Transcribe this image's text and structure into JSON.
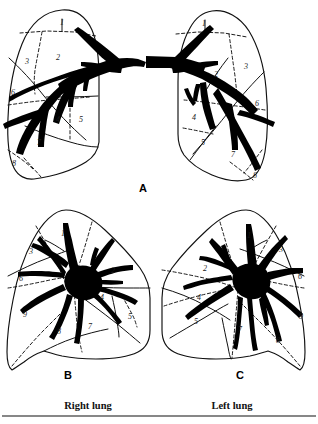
{
  "figure": {
    "background_color": "#ffffff",
    "ink_color": "#111111",
    "bronchus_color": "#000000",
    "width": 318,
    "height": 424
  },
  "panels": [
    {
      "id": "A",
      "letter": "A",
      "letter_x": 143,
      "letter_y": 189,
      "view": "anterior view of both lungs",
      "lungs": [
        {
          "side": "right",
          "segment_labels": [
            {
              "n": "1",
              "x": 62,
              "y": 23
            },
            {
              "n": "2",
              "x": 58,
              "y": 58
            },
            {
              "n": "3",
              "x": 27,
              "y": 62
            },
            {
              "n": "6",
              "x": 13,
              "y": 93
            },
            {
              "n": "4",
              "x": 58,
              "y": 120
            },
            {
              "n": "5",
              "x": 81,
              "y": 120
            },
            {
              "n": "7",
              "x": 39,
              "y": 143
            },
            {
              "n": "8",
              "x": 14,
              "y": 164
            }
          ]
        },
        {
          "side": "left",
          "segment_labels": [
            {
              "n": "1",
              "x": 204,
              "y": 24
            },
            {
              "n": "2",
              "x": 216,
              "y": 75
            },
            {
              "n": "3",
              "x": 246,
              "y": 67
            },
            {
              "n": "6",
              "x": 257,
              "y": 104
            },
            {
              "n": "4",
              "x": 194,
              "y": 118
            },
            {
              "n": "5",
              "x": 203,
              "y": 143
            },
            {
              "n": "7",
              "x": 233,
              "y": 155
            },
            {
              "n": "8",
              "x": 255,
              "y": 176
            }
          ]
        }
      ]
    },
    {
      "id": "B",
      "letter": "B",
      "letter_x": 68,
      "letter_y": 376,
      "view": "right lung medial surface",
      "segment_labels": [
        {
          "n": "1",
          "x": 63,
          "y": 234
        },
        {
          "n": "3",
          "x": 31,
          "y": 252
        },
        {
          "n": "2",
          "x": 113,
          "y": 271
        },
        {
          "n": "6",
          "x": 21,
          "y": 279
        },
        {
          "n": "4",
          "x": 102,
          "y": 298
        },
        {
          "n": "9",
          "x": 25,
          "y": 315
        },
        {
          "n": "5",
          "x": 130,
          "y": 317
        },
        {
          "n": "7",
          "x": 90,
          "y": 327
        },
        {
          "n": "8",
          "x": 59,
          "y": 332
        }
      ]
    },
    {
      "id": "C",
      "letter": "C",
      "letter_x": 240,
      "letter_y": 376,
      "view": "left lung medial surface",
      "segment_labels": [
        {
          "n": "1",
          "x": 249,
          "y": 236
        },
        {
          "n": "3",
          "x": 281,
          "y": 250
        },
        {
          "n": "2",
          "x": 205,
          "y": 269
        },
        {
          "n": "6",
          "x": 300,
          "y": 277
        },
        {
          "n": "4",
          "x": 199,
          "y": 298
        },
        {
          "n": "9",
          "x": 301,
          "y": 317
        },
        {
          "n": "5",
          "x": 196,
          "y": 322
        },
        {
          "n": "7",
          "x": 240,
          "y": 330
        },
        {
          "n": "8",
          "x": 278,
          "y": 341
        }
      ]
    }
  ],
  "captions": {
    "right_lung": {
      "text": "Right lung",
      "x": 88,
      "y": 407
    },
    "left_lung": {
      "text": "Left lung",
      "x": 232,
      "y": 407
    }
  },
  "rule": {
    "y": 416,
    "x1": 2,
    "x2": 316
  }
}
